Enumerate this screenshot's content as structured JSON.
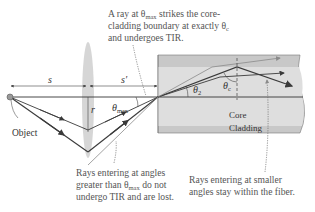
{
  "annotations": {
    "top_line1_pre": "A ray at θ",
    "top_line1_sub": "max",
    "top_line1_post": " strikes the core-",
    "top_line2_pre": "cladding boundary at exactly θ",
    "top_line2_sub": "c",
    "top_line3": "and undergoes TIR.",
    "left_line1": "Rays entering at angles",
    "left_line2_pre": "greater than θ",
    "left_line2_sub": "max",
    "left_line2_post": " do not",
    "left_line3": "undergo TIR and are lost.",
    "right_line1": "Rays entering at smaller",
    "right_line2": "angles stay within the fiber."
  },
  "labels": {
    "s": "s",
    "s_prime": "s′",
    "r": "r",
    "theta_max_base": "θ",
    "theta_max_sub": "max",
    "theta_2_base": "θ",
    "theta_2_sub": "2",
    "theta_c_base": "θ",
    "theta_c_sub": "c",
    "object": "Object",
    "core": "Core",
    "cladding": "Cladding"
  },
  "colors": {
    "cladding": "#c8c8c8",
    "core": "#dedede",
    "lens": "#cfcfcf",
    "ray_dark": "#3a3a3a",
    "ray_light": "#8a8a8a",
    "text": "#555555"
  }
}
